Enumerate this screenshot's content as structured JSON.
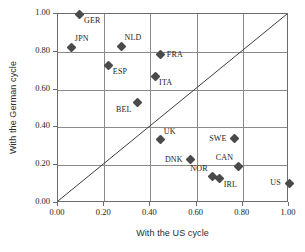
{
  "chart_data": {
    "type": "scatter",
    "title": "",
    "xlabel": "With the US cycle",
    "ylabel": "With the German cycle",
    "xlim": [
      0.0,
      1.0
    ],
    "ylim": [
      0.0,
      1.0
    ],
    "grid": true,
    "legend": "none",
    "xticks": [
      "0.00",
      "0.20",
      "0.40",
      "0.60",
      "0.80",
      "1.00"
    ],
    "yticks": [
      "0.00",
      "0.20",
      "0.40",
      "0.60",
      "0.80",
      "1.00"
    ],
    "xtick_values": [
      0.0,
      0.2,
      0.4,
      0.6,
      0.8,
      1.0
    ],
    "ytick_values": [
      0.0,
      0.2,
      0.4,
      0.6,
      0.8,
      1.0
    ],
    "annotations": [
      {
        "text": "45-degree reference line",
        "from": [
          0.0,
          0.0
        ],
        "to": [
          1.0,
          1.0
        ]
      }
    ],
    "points": [
      {
        "label": "GER",
        "x": 0.095,
        "y": 1.0,
        "label_pos": "below-right"
      },
      {
        "label": "JPN",
        "x": 0.06,
        "y": 0.825,
        "label_pos": "above-right"
      },
      {
        "label": "NLD",
        "x": 0.275,
        "y": 0.83,
        "label_pos": "above-right"
      },
      {
        "label": "ESP",
        "x": 0.22,
        "y": 0.73,
        "label_pos": "below-right"
      },
      {
        "label": "FRA",
        "x": 0.445,
        "y": 0.785,
        "label_pos": "right"
      },
      {
        "label": "ITA",
        "x": 0.42,
        "y": 0.67,
        "label_pos": "below-right"
      },
      {
        "label": "BEL",
        "x": 0.345,
        "y": 0.53,
        "label_pos": "below-left"
      },
      {
        "label": "UK",
        "x": 0.445,
        "y": 0.335,
        "label_pos": "above-right"
      },
      {
        "label": "SWE",
        "x": 0.765,
        "y": 0.34,
        "label_pos": "left"
      },
      {
        "label": "DNK",
        "x": 0.575,
        "y": 0.23,
        "label_pos": "left"
      },
      {
        "label": "CAN",
        "x": 0.78,
        "y": 0.195,
        "label_pos": "above-left"
      },
      {
        "label": "NOR",
        "x": 0.67,
        "y": 0.14,
        "label_pos": "above-left"
      },
      {
        "label": "IRL",
        "x": 0.7,
        "y": 0.13,
        "label_pos": "below-right"
      },
      {
        "label": "US",
        "x": 1.0,
        "y": 0.105,
        "label_pos": "left"
      }
    ],
    "colors": {
      "marker": "#4a4a4a",
      "grid": "#8a8a8a",
      "frame": "#6c6c6c",
      "text": "#1a1a1a",
      "background": "#ffffff"
    }
  }
}
